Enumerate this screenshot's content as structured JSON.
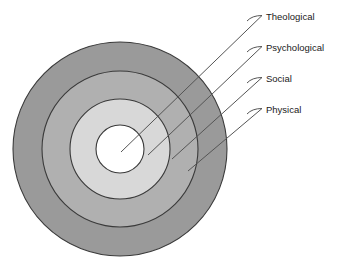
{
  "figure": {
    "type": "concentric-rings-diagram",
    "background_color": "#ffffff",
    "center": {
      "x": 120,
      "y": 149
    },
    "outline_color": "#3a3a3a",
    "leader_color": "#555555",
    "label_color": "#1a1a1a"
  },
  "rings": [
    {
      "label": "Physical",
      "level": 1,
      "position": "outermost",
      "radius": 107,
      "fill": "#9a9a9a",
      "leader": {
        "hook_start_x": 247,
        "hook_end_x": 262,
        "label_y": 110,
        "anchor_x": 188,
        "anchor_y": 171
      },
      "label_x": 266,
      "label_y": 110
    },
    {
      "label": "Social",
      "level": 2,
      "position": "third",
      "radius": 78,
      "fill": "#b0b0b0",
      "leader": {
        "hook_start_x": 247,
        "hook_end_x": 262,
        "label_y": 79,
        "anchor_x": 172,
        "anchor_y": 159
      },
      "label_x": 266,
      "label_y": 79
    },
    {
      "label": "Psychological",
      "level": 3,
      "position": "second",
      "radius": 50,
      "fill": "#d8d8d8",
      "leader": {
        "hook_start_x": 247,
        "hook_end_x": 262,
        "label_y": 48,
        "anchor_x": 148,
        "anchor_y": 155
      },
      "label_x": 266,
      "label_y": 48
    },
    {
      "label": "Theological",
      "level": 4,
      "position": "innermost",
      "radius": 24,
      "fill": "#ffffff",
      "leader": {
        "hook_start_x": 247,
        "hook_end_x": 262,
        "label_y": 17,
        "anchor_x": 121,
        "anchor_y": 152
      },
      "label_x": 266,
      "label_y": 17
    }
  ]
}
